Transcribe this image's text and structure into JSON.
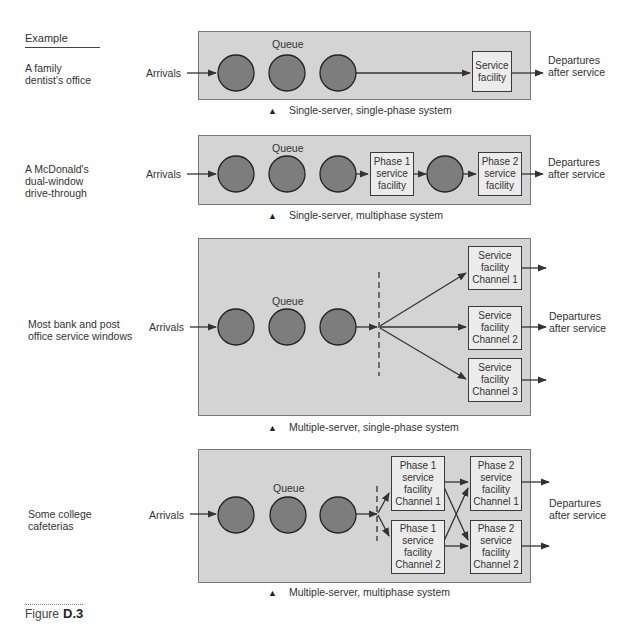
{
  "header": {
    "example_label": "Example"
  },
  "systems": [
    {
      "example": "A family\ndentist's office",
      "arrivals": "Arrivals",
      "queue": "Queue",
      "facilities": [
        "Service\nfacility"
      ],
      "departures": "Departures\nafter service",
      "caption": "Single-server, single-phase system"
    },
    {
      "example": "A McDonald's\ndual-window\ndrive-through",
      "arrivals": "Arrivals",
      "queue": "Queue",
      "facilities": [
        "Phase 1\nservice\nfacility",
        "Phase 2\nservice\nfacility"
      ],
      "departures": "Departures\nafter service",
      "caption": "Single-server, multiphase system"
    },
    {
      "example": "Most bank and post\noffice service windows",
      "arrivals": "Arrivals",
      "queue": "Queue",
      "facilities": [
        "Service\nfacility\nChannel 1",
        "Service\nfacility\nChannel 2",
        "Service\nfacility\nChannel 3"
      ],
      "departures": "Departures\nafter service",
      "caption": "Multiple-server, single-phase system"
    },
    {
      "example": "Some college\ncafeterias",
      "arrivals": "Arrivals",
      "queue": "Queue",
      "facilities": [
        "Phase 1\nservice\nfacility\nChannel 1",
        "Phase 1\nservice\nfacility\nChannel 2",
        "Phase 2\nservice\nfacility\nChannel 1",
        "Phase 2\nservice\nfacility\nChannel 2"
      ],
      "departures": "Departures\nafter service",
      "caption": "Multiple-server, multiphase system"
    }
  ],
  "figure": {
    "prefix": "Figure",
    "number": "D.3"
  },
  "colors": {
    "panel": "#d4d4d4",
    "circle": "#7d7d7d",
    "box": "#ececec",
    "stroke": "#3a3a3a"
  }
}
